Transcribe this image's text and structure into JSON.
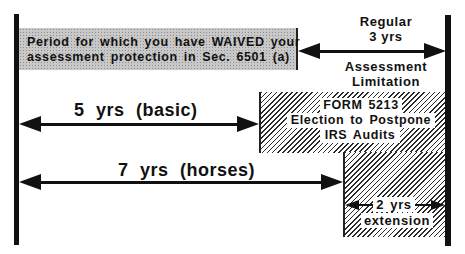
{
  "diagram": {
    "waived_box": {
      "line1": "Period for which you have WAIVED your",
      "line2": "assessment protection in Sec. 6501 (a)"
    },
    "regular": {
      "top1": "Regular",
      "top2": "3 yrs",
      "bottom1": "Assessment",
      "bottom2": "Limitation"
    },
    "basic": {
      "label": "5 yrs  (basic)"
    },
    "horses": {
      "label": "7 yrs  (horses)"
    },
    "form_box": {
      "line1": "FORM  5213",
      "line2": "Election to Postpone",
      "line3": "IRS Audits"
    },
    "extension": {
      "line1": "2 yrs",
      "line2": "extension"
    },
    "colors": {
      "ink": "#111111",
      "gray_fill": "#c8c8c8",
      "background": "#ffffff"
    }
  }
}
